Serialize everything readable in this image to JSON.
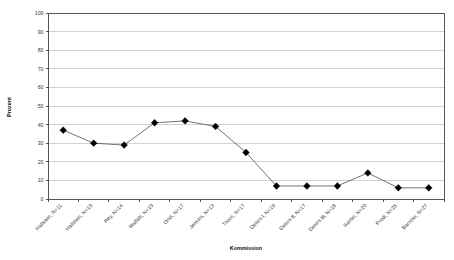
{
  "chart_data": {
    "type": "line",
    "title": "",
    "xlabel": "Kommission",
    "ylabel": "Prozent",
    "ylim": [
      0,
      100
    ],
    "ytick_step": 10,
    "grid": true,
    "legend": null,
    "marker_style": "filled-diamond",
    "line_color": "#4f4f4f",
    "marker_color": "#000000",
    "grid_color": "#bdbdbd",
    "axis_color": "#555555",
    "yticks": [
      0,
      10,
      20,
      30,
      40,
      50,
      60,
      70,
      80,
      90,
      100
    ],
    "categories": [
      "Hallstein, N=11",
      "Hallstein, N=10",
      "Rey,     N=14",
      "Malfatti, N=10",
      "Oriol, N=17",
      "Jenkins, N=13",
      "Thorn, N=17",
      "Delors I, N=19",
      "Delors II, N=17",
      "Delors III, N=18",
      "Santer, N=20",
      "Prodi, N=25",
      "Barroso, N=27"
    ],
    "values": [
      37,
      30,
      29,
      41,
      42,
      39,
      25,
      7,
      7,
      7,
      14,
      6,
      6
    ]
  }
}
